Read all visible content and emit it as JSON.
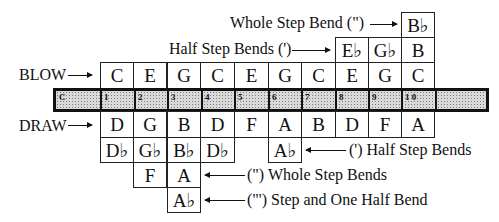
{
  "labels": {
    "blow": "BLOW",
    "draw": "DRAW",
    "blow_whole_step": "Whole Step Bend (\")",
    "blow_half_step": "Half Step Bends (')",
    "draw_half_step": "(') Half Step Bends",
    "draw_whole_step": "(\") Whole Step Bends",
    "draw_step_and_half": "(\"') Step and One Half Bend"
  },
  "comb": {
    "key": "C",
    "holes": [
      "1",
      "2",
      "3",
      "4",
      "5",
      "6",
      "7",
      "8",
      "9",
      "1 0"
    ]
  },
  "blow_notes": [
    "C",
    "E",
    "G",
    "C",
    "E",
    "G",
    "C",
    "E",
    "G",
    "C"
  ],
  "draw_notes": [
    "D",
    "G",
    "B",
    "D",
    "F",
    "A",
    "B",
    "D",
    "F",
    "A"
  ],
  "blow_half_step_bends": {
    "8": "E♭",
    "9": "G♭",
    "10": "B"
  },
  "blow_whole_step_bends": {
    "10": "B♭"
  },
  "draw_half_step_bends": {
    "1": "D♭",
    "2": "G♭",
    "3": "B♭",
    "4": "D♭",
    "6": "A♭"
  },
  "draw_whole_step_bends": {
    "2": "F",
    "3": "A"
  },
  "draw_step_and_half_bends": {
    "3": "A♭"
  },
  "colors": {
    "line": "#111111",
    "strip": "#d9d9d9",
    "background": "#ffffff"
  }
}
